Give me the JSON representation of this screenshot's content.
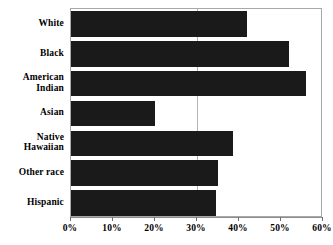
{
  "chart_data": {
    "type": "bar",
    "orientation": "horizontal",
    "title": "",
    "subtitle": "",
    "xlabel": "",
    "ylabel": "",
    "categories": [
      "White",
      "Black",
      "American Indian",
      "Asian",
      "Native Hawaiian",
      "Other race",
      "Hispanic"
    ],
    "category_lines": [
      [
        "White"
      ],
      [
        "Black"
      ],
      [
        "American",
        "Indian"
      ],
      [
        "Asian"
      ],
      [
        "Native",
        "Hawaiian"
      ],
      [
        "Other race"
      ],
      [
        "Hispanic"
      ]
    ],
    "values": [
      42,
      52,
      56,
      20,
      38.5,
      35,
      34.5
    ],
    "value_labels": [
      "42%",
      "52%",
      "56%",
      "20%",
      "38.5%",
      "35%",
      "34.5%"
    ],
    "xlim": [
      0,
      60
    ],
    "xticks": [
      0,
      10,
      20,
      30,
      40,
      50,
      60
    ],
    "xtick_labels": [
      "0%",
      "10%",
      "20%",
      "30%",
      "40%",
      "50%",
      "60%"
    ],
    "grid": true,
    "gridlines_at": [
      30
    ],
    "legend": null,
    "legend_position": "none",
    "annotations": [],
    "bar_color": "#1a1a1a",
    "background_color": "#ffffff",
    "axis_color": "#a8a8a8",
    "grid_color": "#b4b4b4"
  }
}
